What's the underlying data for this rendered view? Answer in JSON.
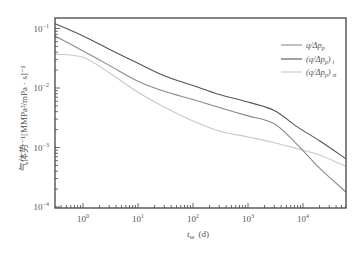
{
  "chart_data": {
    "type": "line",
    "title": "",
    "xlabel": "t_se (d)",
    "ylabel": "气体势^-1 [MMPa²/mPa·s]^-1",
    "xscale": "log",
    "yscale": "log",
    "xlim": [
      0.3,
      60000
    ],
    "ylim": [
      0.0001,
      0.15
    ],
    "grid": false,
    "legend_position": "upper right",
    "x_ticks": [
      "10^0",
      "10^1",
      "10^2",
      "10^3",
      "10^4"
    ],
    "y_ticks": [
      "10^-4",
      "10^-3",
      "10^-2",
      "10^-1"
    ],
    "x": [
      0.3,
      1,
      3,
      10,
      30,
      100,
      300,
      1000,
      3000,
      8000,
      20000,
      60000
    ],
    "series": [
      {
        "name": "q/Δp_p",
        "color": "#8a8a8a",
        "values": [
          0.075,
          0.042,
          0.024,
          0.013,
          0.0088,
          0.0064,
          0.0047,
          0.0034,
          0.0025,
          0.0011,
          0.00045,
          0.00018
        ]
      },
      {
        "name": "(q/Δp_p)_i",
        "color": "#555555",
        "values": [
          0.12,
          0.075,
          0.045,
          0.026,
          0.016,
          0.011,
          0.0078,
          0.0058,
          0.0042,
          0.0022,
          0.0013,
          0.00065
        ]
      },
      {
        "name": "(q/Δp_p)_st",
        "color": "#c8c8c8",
        "values": [
          0.037,
          0.033,
          0.018,
          0.0085,
          0.0048,
          0.0028,
          0.0019,
          0.0015,
          0.0012,
          0.00095,
          0.00075,
          0.00048
        ]
      }
    ]
  },
  "labels": {
    "x_axis_title_var": "t",
    "x_axis_title_sub": "se",
    "x_axis_title_unit": "(d)",
    "y_axis_title": "气体势⁻¹[MMPa²/mPa · s]⁻¹",
    "legend": [
      {
        "main": "q/Δp",
        "sub": "p",
        "suffix": ""
      },
      {
        "main": "(q/Δp",
        "sub": "p",
        "suffix": ")",
        "sub2": "i"
      },
      {
        "main": "(q/Δp",
        "sub": "p",
        "suffix": ")",
        "sub2": "st"
      }
    ]
  }
}
